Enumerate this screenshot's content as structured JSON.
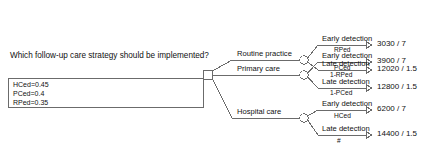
{
  "diagram": {
    "type": "decision-tree",
    "question": "Which follow-up care strategy should be implemented?",
    "variables": [
      {
        "name": "HCed",
        "expr": "HCed=0.45"
      },
      {
        "name": "PCed",
        "expr": "PCed=0.4"
      },
      {
        "name": "RPed",
        "expr": "RPed=0.35"
      }
    ],
    "branches": [
      {
        "label": "Routine practice",
        "outcomes": [
          {
            "label": "Early detection",
            "probability": "RPed",
            "payoff": "3030 / 7"
          },
          {
            "label": "Late detection",
            "probability": "1-RPed",
            "payoff": "12020 / 1.5"
          }
        ]
      },
      {
        "label": "Primary care",
        "outcomes": [
          {
            "label": "Early detection",
            "probability": "PCed",
            "payoff": "3900 / 7"
          },
          {
            "label": "Late detection",
            "probability": "1-PCed",
            "payoff": "12800 / 1.5"
          }
        ]
      },
      {
        "label": "Hospital care",
        "outcomes": [
          {
            "label": "Early detection",
            "probability": "HCed",
            "payoff": "6200 / 7"
          },
          {
            "label": "Late detection",
            "probability": "#",
            "payoff": "14400 / 1.5"
          }
        ]
      }
    ],
    "colors": {
      "line": "#6b6b6b",
      "text": "#111111",
      "background": "#ffffff"
    }
  }
}
